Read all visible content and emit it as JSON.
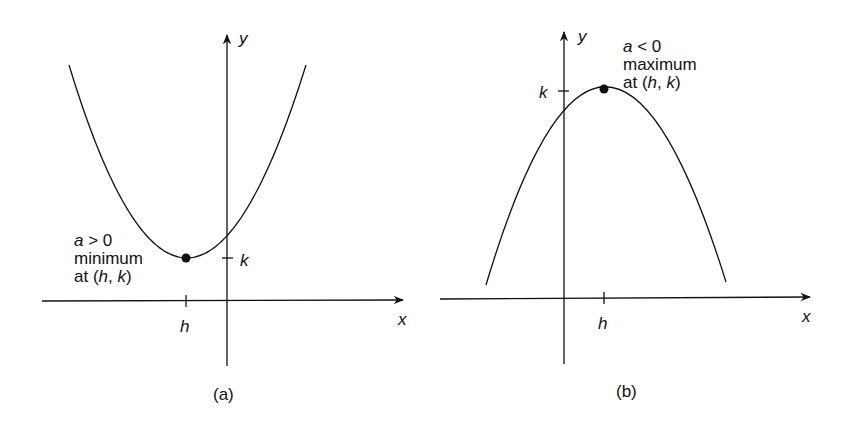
{
  "panels": [
    {
      "id": "a",
      "caption": "(a)",
      "x_axis_label": "x",
      "y_axis_label": "y",
      "h_label": "h",
      "k_label": "k",
      "annotation": {
        "line1_var": "a",
        "line1_rest": " > 0",
        "line2": "minimum",
        "line3_prefix": "at (",
        "line3_h": "h",
        "line3_sep": ", ",
        "line3_k": "k",
        "line3_suffix": ")"
      }
    },
    {
      "id": "b",
      "caption": "(b)",
      "x_axis_label": "x",
      "y_axis_label": "y",
      "h_label": "h",
      "k_label": "k",
      "annotation": {
        "line1_var": "a",
        "line1_rest": " < 0",
        "line2": "maximum",
        "line3_prefix": "at (",
        "line3_h": "h",
        "line3_sep": ", ",
        "line3_k": "k",
        "line3_suffix": ")"
      }
    }
  ],
  "colors": {
    "ink": "#111111",
    "background": "#ffffff"
  }
}
